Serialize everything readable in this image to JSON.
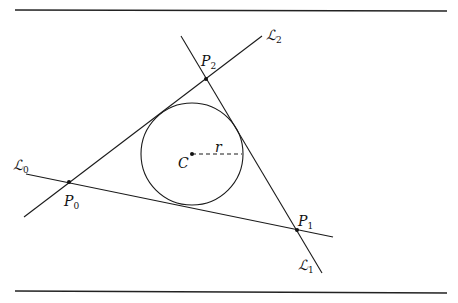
{
  "diagram": {
    "lines": [
      {
        "name": "L",
        "subscript": "0",
        "from": [
          26,
          174
        ],
        "to": [
          333,
          237
        ],
        "label_pos": [
          13,
          170
        ]
      },
      {
        "name": "L",
        "subscript": "1",
        "from": [
          181,
          36
        ],
        "to": [
          322,
          273
        ],
        "label_pos": [
          298,
          268
        ]
      },
      {
        "name": "L",
        "subscript": "2",
        "from": [
          24,
          217
        ],
        "to": [
          262,
          36
        ],
        "label_pos": [
          267,
          40
        ]
      }
    ],
    "points": [
      {
        "name": "P",
        "subscript": "0",
        "x": 69,
        "y": 182,
        "label_pos": [
          64,
          205
        ]
      },
      {
        "name": "P",
        "subscript": "1",
        "x": 297,
        "y": 230,
        "label_pos": [
          298,
          225
        ]
      },
      {
        "name": "P",
        "subscript": "2",
        "x": 206,
        "y": 79,
        "label_pos": [
          200,
          67
        ]
      }
    ],
    "circle": {
      "center_label": "C",
      "cx": 192,
      "cy": 154,
      "r": 51,
      "center_label_pos": [
        178,
        167
      ]
    },
    "radius": {
      "label": "r",
      "from": [
        192,
        154
      ],
      "to": [
        242,
        154
      ],
      "label_pos": [
        215,
        151
      ]
    },
    "rules": {
      "top_y": 10,
      "bottom_y": 292,
      "x1": 15,
      "x2": 447
    }
  }
}
